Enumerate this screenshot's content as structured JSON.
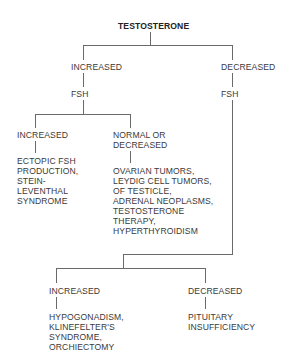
{
  "diagram": {
    "root": "TESTOSTERONE",
    "branches": {
      "increased": {
        "label": "INCREASED",
        "test": "FSH",
        "children": {
          "increased": {
            "label": "INCREASED",
            "result": "ECTOPIC FSH\nPRODUCTION,\nSTEIN-\nLEVENTHAL\nSYNDROME"
          },
          "normal_or_decreased": {
            "label": "NORMAL OR\nDECREASED",
            "result": "OVARIAN TUMORS,\nLEYDIG CELL TUMORS,\nOF TESTICLE,\nADRENAL NEOPLASMS,\nTESTOSTERONE\nTHERAPY,\nHYPERTHYROIDISM"
          }
        }
      },
      "decreased": {
        "label": "DECREASED",
        "test": "FSH",
        "children": {
          "increased": {
            "label": "INCREASED",
            "result": "HYPOGONADISM,\nKLINEFELTER'S\nSYNDROME,\nORCHIECTOMY"
          },
          "decreased": {
            "label": "DECREASED",
            "result": "PITUITARY\nINSUFFICIENCY"
          }
        }
      }
    }
  }
}
